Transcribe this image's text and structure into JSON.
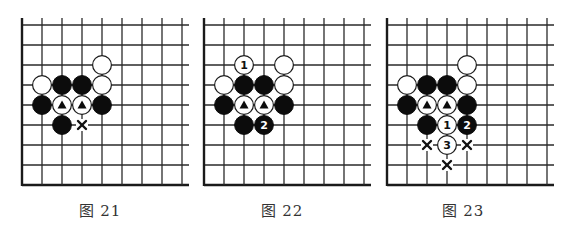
{
  "figure": {
    "grid": {
      "spacing": 20,
      "rows": 9,
      "cols": 9,
      "top_y": 25,
      "bottom_y": 185,
      "vline_top_y": 18,
      "overhang_right": 7
    },
    "colors": {
      "line": "#2a2a2a",
      "black_stone": "#0c0c0c",
      "white_stone": "#ffffff",
      "caption": "#333333"
    },
    "boards": [
      {
        "id": "diagram-21",
        "caption": "图 21",
        "origin_x": 22,
        "caption_center_x": 100,
        "stones": [
          {
            "color": "white",
            "col": 4,
            "row": 2
          },
          {
            "color": "white",
            "col": 1,
            "row": 3
          },
          {
            "color": "black",
            "col": 2,
            "row": 3
          },
          {
            "color": "black",
            "col": 3,
            "row": 3
          },
          {
            "color": "white",
            "col": 4,
            "row": 3
          },
          {
            "color": "black",
            "col": 1,
            "row": 4
          },
          {
            "color": "white",
            "col": 2,
            "row": 4,
            "mark": "triangle"
          },
          {
            "color": "white",
            "col": 3,
            "row": 4,
            "mark": "triangle"
          },
          {
            "color": "black",
            "col": 4,
            "row": 4
          },
          {
            "color": "black",
            "col": 2,
            "row": 5
          }
        ],
        "x_marks": [
          {
            "col": 3,
            "row": 5
          }
        ]
      },
      {
        "id": "diagram-22",
        "caption": "图 22",
        "origin_x": 204,
        "caption_center_x": 282,
        "stones": [
          {
            "color": "white",
            "col": 2,
            "row": 2,
            "label": "1"
          },
          {
            "color": "white",
            "col": 4,
            "row": 2
          },
          {
            "color": "white",
            "col": 1,
            "row": 3
          },
          {
            "color": "black",
            "col": 2,
            "row": 3
          },
          {
            "color": "black",
            "col": 3,
            "row": 3
          },
          {
            "color": "white",
            "col": 4,
            "row": 3
          },
          {
            "color": "black",
            "col": 1,
            "row": 4
          },
          {
            "color": "white",
            "col": 2,
            "row": 4,
            "mark": "triangle"
          },
          {
            "color": "white",
            "col": 3,
            "row": 4,
            "mark": "triangle"
          },
          {
            "color": "black",
            "col": 4,
            "row": 4
          },
          {
            "color": "black",
            "col": 2,
            "row": 5
          },
          {
            "color": "black",
            "col": 3,
            "row": 5,
            "label": "2"
          }
        ],
        "x_marks": []
      },
      {
        "id": "diagram-23",
        "caption": "图 23",
        "origin_x": 387,
        "caption_center_x": 463,
        "stones": [
          {
            "color": "white",
            "col": 4,
            "row": 2
          },
          {
            "color": "white",
            "col": 1,
            "row": 3
          },
          {
            "color": "black",
            "col": 2,
            "row": 3
          },
          {
            "color": "black",
            "col": 3,
            "row": 3
          },
          {
            "color": "white",
            "col": 4,
            "row": 3
          },
          {
            "color": "black",
            "col": 1,
            "row": 4
          },
          {
            "color": "white",
            "col": 2,
            "row": 4,
            "mark": "triangle"
          },
          {
            "color": "white",
            "col": 3,
            "row": 4,
            "mark": "triangle"
          },
          {
            "color": "black",
            "col": 4,
            "row": 4
          },
          {
            "color": "black",
            "col": 2,
            "row": 5
          },
          {
            "color": "white",
            "col": 3,
            "row": 5,
            "label": "1"
          },
          {
            "color": "black",
            "col": 4,
            "row": 5,
            "label": "2"
          },
          {
            "color": "white",
            "col": 3,
            "row": 6,
            "label": "3"
          }
        ],
        "x_marks": [
          {
            "col": 2,
            "row": 6
          },
          {
            "col": 4,
            "row": 6
          },
          {
            "col": 3,
            "row": 7
          }
        ]
      }
    ]
  }
}
